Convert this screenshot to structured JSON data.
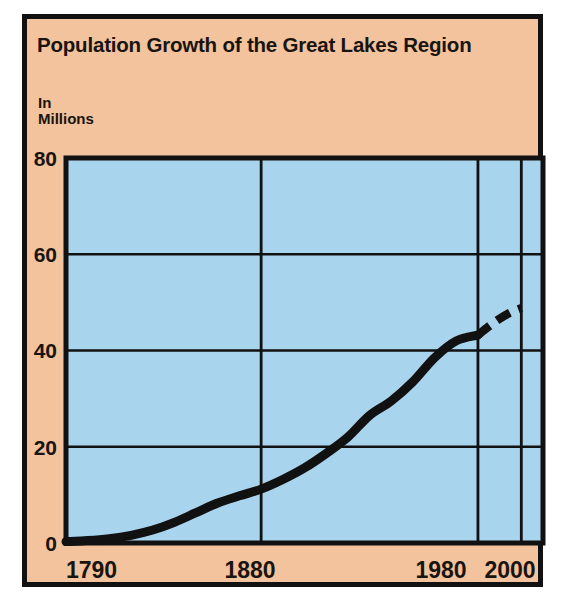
{
  "card": {
    "background_color": "#F2C39C",
    "border_color": "#111111"
  },
  "chart_data": {
    "type": "line",
    "title": "Population Growth of the Great Lakes Region",
    "ylabel": "In\nMillions",
    "ylabel_line1": "In",
    "ylabel_line2": "Millions",
    "xlabel": "",
    "xlim": [
      1790,
      2010
    ],
    "ylim": [
      0,
      80
    ],
    "yticks": [
      0,
      20,
      40,
      60,
      80
    ],
    "ytick_labels": [
      "0",
      "20",
      "40",
      "60",
      "80"
    ],
    "xticks": [
      1790,
      1880,
      1980,
      2000
    ],
    "xtick_labels": [
      "1790",
      "1880",
      "1980",
      "2000"
    ],
    "grid": true,
    "gridlines_vertical_years": [
      1880,
      1980,
      2000
    ],
    "gridlines_horizontal_values": [
      20,
      40,
      60
    ],
    "legend": "none",
    "plot_background_color": "#A8D4EE",
    "line_color": "#111111",
    "series": [
      {
        "name": "Population (millions)",
        "style": "solid",
        "x": [
          1790,
          1800,
          1810,
          1820,
          1830,
          1840,
          1850,
          1860,
          1870,
          1880,
          1890,
          1900,
          1910,
          1920,
          1930,
          1940,
          1950,
          1960,
          1970,
          1980
        ],
        "values": [
          0.3,
          0.5,
          0.9,
          1.6,
          2.7,
          4.3,
          6.3,
          8.3,
          9.8,
          11.2,
          13.2,
          15.6,
          18.6,
          22.0,
          26.5,
          29.5,
          33.5,
          38.5,
          42.0,
          43.2
        ]
      },
      {
        "name": "Projected population (millions)",
        "style": "dashed",
        "x": [
          1980,
          1985,
          1990,
          1995,
          2000
        ],
        "values": [
          43.2,
          45.0,
          46.6,
          47.9,
          48.8
        ]
      }
    ],
    "annotations": [
      {
        "text": "Dashed segment from 1980 to 2000 indicates projection",
        "x": 1990,
        "y": 46.6
      }
    ]
  }
}
